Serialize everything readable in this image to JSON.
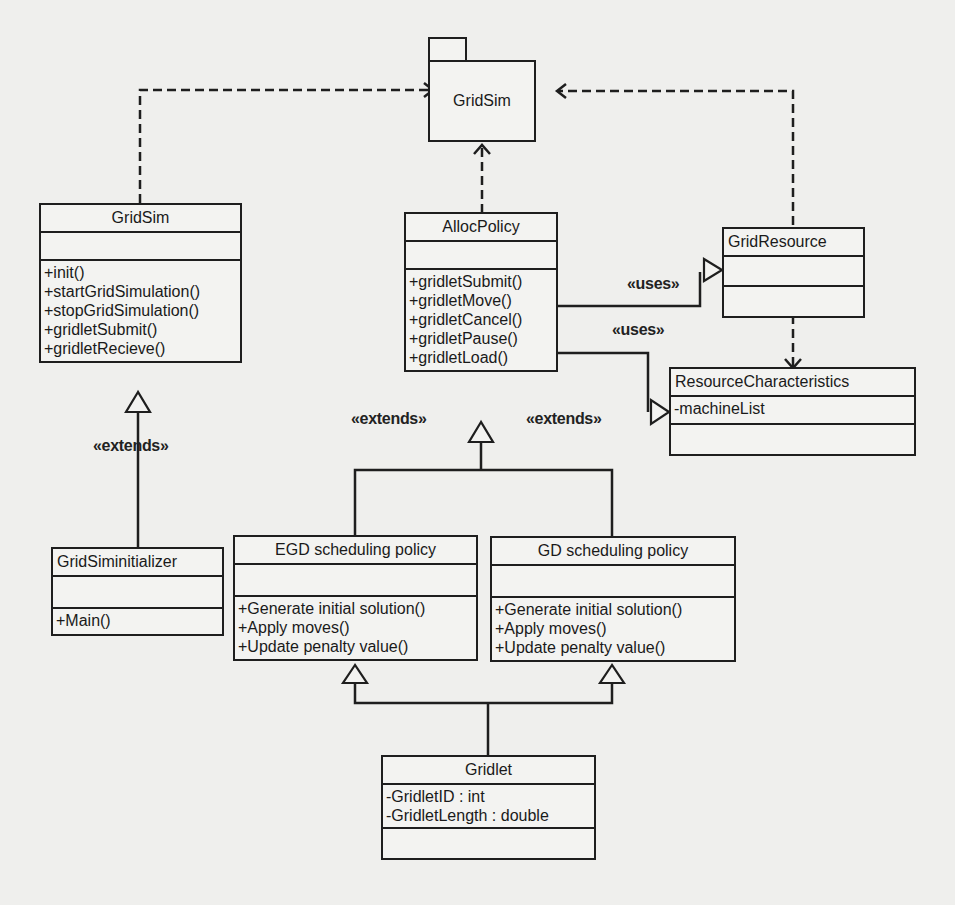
{
  "package": {
    "name": "GridSim"
  },
  "classes": {
    "gridsim": {
      "name": "GridSim",
      "attributes": [],
      "operations": [
        "+init()",
        "+startGridSimulation()",
        "+stopGridSimulation()",
        "+gridletSubmit()",
        "+gridletRecieve()"
      ]
    },
    "allocpolicy": {
      "name": "AllocPolicy",
      "attributes": [],
      "operations": [
        "+gridletSubmit()",
        "+gridletMove()",
        "+gridletCancel()",
        "+gridletPause()",
        "+gridletLoad()"
      ]
    },
    "gridresource": {
      "name": "GridResource",
      "attributes": [],
      "operations": []
    },
    "resourcecharacteristics": {
      "name": "ResourceCharacteristics",
      "attributes": [
        "-machineList"
      ],
      "operations": []
    },
    "gridsiminitializer": {
      "name": "GridSiminitializer",
      "attributes": [],
      "operations": [
        "+Main()"
      ]
    },
    "egd": {
      "name": "EGD scheduling policy",
      "attributes": [],
      "operations": [
        "+Generate initial solution()",
        "+Apply moves()",
        "+Update penalty value()"
      ]
    },
    "gd": {
      "name": "GD scheduling policy",
      "attributes": [],
      "operations": [
        "+Generate initial solution()",
        "+Apply moves()",
        "+Update penalty value()"
      ]
    },
    "gridlet": {
      "name": "Gridlet",
      "attributes": [
        "-GridletID : int",
        "-GridletLength : double"
      ],
      "operations": []
    }
  },
  "labels": {
    "extends_gridsim": "«extends»",
    "extends_egd": "«extends»",
    "extends_gd": "«extends»",
    "uses_gridresource": "«uses»",
    "uses_resourcechar": "«uses»"
  },
  "colors": {
    "line": "#1e1e1e",
    "background": "#efefed",
    "box": "#f3f3f1"
  }
}
